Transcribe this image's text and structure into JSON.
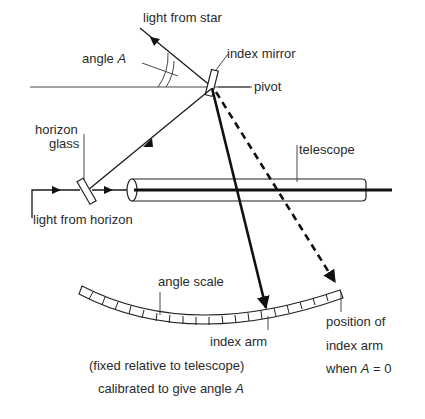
{
  "labels": {
    "light_from_star": "light from star",
    "angle_A_prefix": "angle ",
    "angle_A_var": "A",
    "index_mirror": "index mirror",
    "pivot": "pivot",
    "horizon_glass_1": "horizon",
    "horizon_glass_2": "glass",
    "telescope": "telescope",
    "light_from_horizon": "light from horizon",
    "angle_scale": "angle scale",
    "index_arm": "index arm",
    "index_arm_note_1": "(fixed relative to telescope)",
    "index_arm_note_2_prefix": "calibrated to give angle ",
    "index_arm_note_2_var": "A",
    "position_1": "position of",
    "position_2": "index arm",
    "position_3_prefix": "when ",
    "position_3_var": "A",
    "position_3_suffix": " = 0"
  }
}
